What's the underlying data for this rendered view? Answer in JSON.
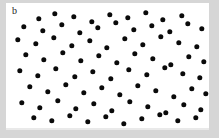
{
  "figure": {
    "panel_label": "b",
    "background_color": "#d6d6d6",
    "panel_color": "#ffffff",
    "dot_color": "#0a0a0a",
    "panel": {
      "x": 6,
      "y": 3,
      "width": 203,
      "height": 125
    }
  },
  "chart_data": {
    "type": "scatter",
    "title": "b",
    "xlabel": "",
    "ylabel": "",
    "grid": false,
    "legend": null,
    "axes_visible": false,
    "marker": {
      "shape": "circle",
      "color": "#0a0a0a",
      "size_px": 5.4
    },
    "xlim": [
      0,
      203
    ],
    "ylim": [
      0,
      125
    ],
    "note": "Random point pattern; coordinates are in panel pixel space, origin top-left.",
    "n_points": 83,
    "points": [
      [
        103,
        38
      ],
      [
        149,
        38
      ],
      [
        189,
        40
      ],
      [
        214,
        38
      ],
      [
        244,
        42
      ],
      [
        275,
        37
      ],
      [
        72,
        52
      ],
      [
        124,
        51
      ],
      [
        155,
        55
      ],
      [
        208,
        53
      ],
      [
        262,
        50
      ],
      [
        300,
        48
      ],
      [
        33,
        56
      ],
      [
        113,
        62
      ],
      [
        166,
        47
      ],
      [
        88,
        70
      ],
      [
        131,
        73
      ],
      [
        180,
        66
      ],
      [
        224,
        63
      ],
      [
        270,
        62
      ],
      [
        305,
        68
      ],
      [
        46,
        75
      ],
      [
        104,
        84
      ],
      [
        145,
        80
      ],
      [
        196,
        86
      ],
      [
        250,
        79
      ],
      [
        288,
        84
      ],
      [
        27,
        90
      ],
      [
        66,
        92
      ],
      [
        118,
        98
      ],
      [
        163,
        95
      ],
      [
        213,
        94
      ],
      [
        261,
        97
      ],
      [
        299,
        92
      ],
      [
        52,
        104
      ],
      [
        92,
        110
      ],
      [
        138,
        107
      ],
      [
        186,
        112
      ],
      [
        232,
        108
      ],
      [
        277,
        106
      ],
      [
        34,
        118
      ],
      [
        79,
        122
      ],
      [
        124,
        120
      ],
      [
        170,
        124
      ],
      [
        219,
        119
      ],
      [
        266,
        122
      ],
      [
        302,
        116
      ]
    ],
    "points_rendered": [
      [
        33,
        16
      ],
      [
        49,
        11
      ],
      [
        68,
        14
      ],
      [
        86,
        19
      ],
      [
        104,
        12
      ],
      [
        122,
        15
      ],
      [
        140,
        10
      ],
      [
        157,
        17
      ],
      [
        176,
        13
      ],
      [
        18,
        24
      ],
      [
        37,
        28
      ],
      [
        56,
        22
      ],
      [
        74,
        30
      ],
      [
        92,
        25
      ],
      [
        110,
        20
      ],
      [
        128,
        27
      ],
      [
        146,
        23
      ],
      [
        164,
        29
      ],
      [
        182,
        21
      ],
      [
        196,
        26
      ],
      [
        12,
        37
      ],
      [
        30,
        41
      ],
      [
        48,
        35
      ],
      [
        66,
        43
      ],
      [
        84,
        38
      ],
      [
        101,
        45
      ],
      [
        119,
        36
      ],
      [
        137,
        42
      ],
      [
        155,
        34
      ],
      [
        173,
        40
      ],
      [
        191,
        44
      ],
      [
        20,
        52
      ],
      [
        38,
        57
      ],
      [
        57,
        50
      ],
      [
        75,
        58
      ],
      [
        93,
        53
      ],
      [
        111,
        60
      ],
      [
        129,
        51
      ],
      [
        147,
        56
      ],
      [
        165,
        62
      ],
      [
        183,
        54
      ],
      [
        198,
        59
      ],
      [
        14,
        68
      ],
      [
        32,
        73
      ],
      [
        50,
        66
      ],
      [
        69,
        74
      ],
      [
        87,
        69
      ],
      [
        105,
        76
      ],
      [
        123,
        67
      ],
      [
        141,
        72
      ],
      [
        159,
        65
      ],
      [
        177,
        71
      ],
      [
        194,
        75
      ],
      [
        24,
        84
      ],
      [
        42,
        89
      ],
      [
        60,
        82
      ],
      [
        78,
        90
      ],
      [
        96,
        85
      ],
      [
        114,
        92
      ],
      [
        132,
        83
      ],
      [
        150,
        88
      ],
      [
        168,
        94
      ],
      [
        186,
        86
      ],
      [
        200,
        91
      ],
      [
        16,
        100
      ],
      [
        34,
        105
      ],
      [
        52,
        98
      ],
      [
        70,
        106
      ],
      [
        88,
        101
      ],
      [
        106,
        108
      ],
      [
        124,
        99
      ],
      [
        142,
        104
      ],
      [
        160,
        110
      ],
      [
        178,
        102
      ],
      [
        195,
        107
      ],
      [
        28,
        115
      ],
      [
        46,
        118
      ],
      [
        64,
        113
      ],
      [
        82,
        119
      ],
      [
        100,
        114
      ],
      [
        118,
        121
      ],
      [
        136,
        116
      ],
      [
        154,
        112
      ],
      [
        172,
        118
      ],
      [
        190,
        115
      ]
    ]
  }
}
